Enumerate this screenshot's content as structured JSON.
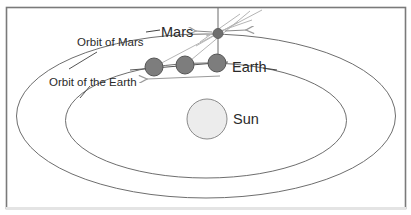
{
  "diagram": {
    "labels": {
      "mars": "Mars",
      "earth": "Earth",
      "sun": "Sun",
      "orbit_mars": "Orbit of Mars",
      "orbit_earth": "Orbit of the Earth"
    },
    "colors": {
      "frame": "#7a7a7a",
      "orbit": "#6e6e6e",
      "planet_fill": "#7d7d7d",
      "planet_stroke": "#555555",
      "sun_fill": "#ececec",
      "sun_stroke": "#8a8a8a",
      "sightline": "#b5b5b5",
      "arrow": "#9a9a9a",
      "text": "#2a2a2a"
    },
    "earth_positions": 3,
    "mars_positions": 1
  }
}
